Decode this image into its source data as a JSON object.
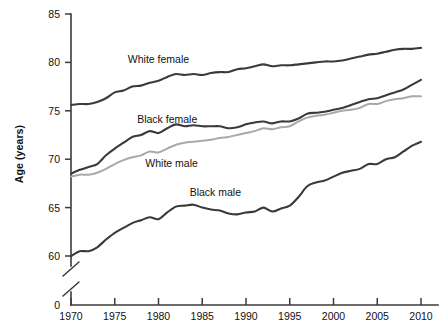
{
  "chart_data": {
    "type": "line",
    "title": "",
    "xlabel": "",
    "ylabel": "Age (years)",
    "xlim": [
      1970,
      2010
    ],
    "ylim": [
      58.5,
      85
    ],
    "grid": false,
    "legend_position": "inline-annotations",
    "axis_break": true,
    "axis_break_note": "y-axis broken between 0 and 60",
    "x_ticks": [
      1970,
      1975,
      1980,
      1985,
      1990,
      1995,
      2000,
      2005,
      2010
    ],
    "x_tick_labels": [
      "1970",
      "1975",
      "1980",
      "1985",
      "1990",
      "1995",
      "2000",
      "2005",
      "2010"
    ],
    "y_ticks": [
      0,
      60,
      65,
      70,
      75,
      80,
      85
    ],
    "y_tick_labels": [
      "0",
      "60",
      "65",
      "70",
      "75",
      "80",
      "85"
    ],
    "x": [
      1970,
      1971,
      1972,
      1973,
      1974,
      1975,
      1976,
      1977,
      1978,
      1979,
      1980,
      1981,
      1982,
      1983,
      1984,
      1985,
      1986,
      1987,
      1988,
      1989,
      1990,
      1991,
      1992,
      1993,
      1994,
      1995,
      1996,
      1997,
      1998,
      1999,
      2000,
      2001,
      2002,
      2003,
      2004,
      2005,
      2006,
      2007,
      2008,
      2009,
      2010
    ],
    "series": [
      {
        "name": "White female",
        "color": "#3a3a3a",
        "label_x": 1980,
        "label_y": 80.3,
        "values": [
          75.6,
          75.7,
          75.7,
          75.9,
          76.3,
          76.9,
          77.1,
          77.5,
          77.6,
          77.9,
          78.1,
          78.5,
          78.8,
          78.7,
          78.8,
          78.7,
          78.9,
          79.0,
          79.0,
          79.3,
          79.4,
          79.6,
          79.8,
          79.6,
          79.7,
          79.7,
          79.8,
          79.9,
          80.0,
          80.1,
          80.1,
          80.2,
          80.4,
          80.6,
          80.8,
          80.9,
          81.1,
          81.3,
          81.4,
          81.4,
          81.5
        ]
      },
      {
        "name": "Black female",
        "color": "#3a3a3a",
        "label_x": 1981,
        "label_y": 74.2,
        "values": [
          68.5,
          68.9,
          69.2,
          69.5,
          70.4,
          71.1,
          71.7,
          72.3,
          72.5,
          72.9,
          72.7,
          73.2,
          73.6,
          73.4,
          73.5,
          73.4,
          73.4,
          73.4,
          73.2,
          73.3,
          73.6,
          73.8,
          73.9,
          73.7,
          73.9,
          73.9,
          74.2,
          74.7,
          74.8,
          74.9,
          75.1,
          75.3,
          75.6,
          75.9,
          76.2,
          76.3,
          76.6,
          76.9,
          77.2,
          77.7,
          78.2
        ]
      },
      {
        "name": "White male",
        "color": "#a9a9a9",
        "label_x": 1981.5,
        "label_y": 69.6,
        "values": [
          68.2,
          68.4,
          68.4,
          68.6,
          69.0,
          69.5,
          69.9,
          70.2,
          70.4,
          70.8,
          70.7,
          71.1,
          71.5,
          71.7,
          71.8,
          71.9,
          72.0,
          72.2,
          72.3,
          72.5,
          72.7,
          72.9,
          73.2,
          73.1,
          73.3,
          73.4,
          73.9,
          74.3,
          74.5,
          74.6,
          74.8,
          75.0,
          75.1,
          75.3,
          75.7,
          75.7,
          76.0,
          76.2,
          76.3,
          76.5,
          76.5
        ]
      },
      {
        "name": "Black male",
        "color": "#3a3a3a",
        "label_x": 1986.5,
        "label_y": 66.6,
        "values": [
          60.0,
          60.5,
          60.5,
          60.9,
          61.7,
          62.4,
          62.9,
          63.4,
          63.7,
          64.0,
          63.8,
          64.5,
          65.1,
          65.2,
          65.3,
          65.0,
          64.8,
          64.7,
          64.4,
          64.3,
          64.5,
          64.6,
          65.0,
          64.6,
          64.9,
          65.2,
          66.1,
          67.2,
          67.6,
          67.8,
          68.2,
          68.6,
          68.8,
          69.0,
          69.5,
          69.5,
          70.0,
          70.2,
          70.8,
          71.4,
          71.8
        ]
      }
    ]
  }
}
